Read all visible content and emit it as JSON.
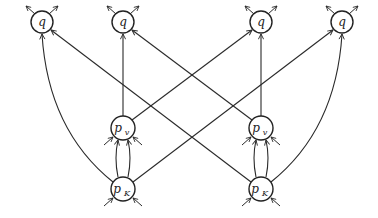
{
  "diagram": {
    "nodes": [
      {
        "id": "q1",
        "label": "q",
        "subscript": "",
        "x": 42,
        "y": 22,
        "r": 11
      },
      {
        "id": "q2",
        "label": "q",
        "subscript": "",
        "x": 123,
        "y": 22,
        "r": 11
      },
      {
        "id": "q3",
        "label": "q",
        "subscript": "",
        "x": 261,
        "y": 22,
        "r": 11
      },
      {
        "id": "q4",
        "label": "q",
        "subscript": "",
        "x": 342,
        "y": 22,
        "r": 11
      },
      {
        "id": "pv1",
        "label": "p",
        "subscript": "v",
        "x": 123,
        "y": 128,
        "r": 12
      },
      {
        "id": "pv2",
        "label": "p",
        "subscript": "v",
        "x": 261,
        "y": 128,
        "r": 12
      },
      {
        "id": "pk1",
        "label": "p",
        "subscript": "K",
        "x": 123,
        "y": 189,
        "r": 12
      },
      {
        "id": "pk2",
        "label": "p",
        "subscript": "K",
        "x": 261,
        "y": 189,
        "r": 12
      }
    ],
    "edges": [
      {
        "from": "pv1",
        "to": "q2",
        "shape": "straight"
      },
      {
        "from": "pv1",
        "to": "q3",
        "shape": "straight"
      },
      {
        "from": "pv2",
        "to": "q3",
        "shape": "straight"
      },
      {
        "from": "pv2",
        "to": "q2",
        "shape": "straight"
      },
      {
        "from": "pk1",
        "to": "q1",
        "shape": "curved"
      },
      {
        "from": "pk1",
        "to": "q4",
        "shape": "straight"
      },
      {
        "from": "pk2",
        "to": "q4",
        "shape": "curved"
      },
      {
        "from": "pk2",
        "to": "q1",
        "shape": "straight"
      },
      {
        "from": "pk1",
        "to": "pv1",
        "shape": "double-vertical"
      },
      {
        "from": "pk2",
        "to": "pv2",
        "shape": "double-vertical"
      }
    ],
    "colors": {
      "stroke": "#222222",
      "background": "#ffffff"
    }
  }
}
